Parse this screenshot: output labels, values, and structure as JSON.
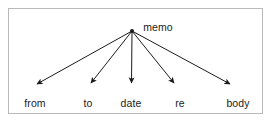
{
  "diagram": {
    "type": "tree",
    "title_visible": false,
    "root": {
      "label": "memo",
      "node_icon": "filled-dot-node",
      "x": 132,
      "y": 31,
      "label_x": 158,
      "label_y": 21
    },
    "children": [
      {
        "label": "from",
        "x": 35,
        "y": 97,
        "arrow_tip_x": 36,
        "arrow_tip_y": 88,
        "arrow": "solid-arrowhead"
      },
      {
        "label": "to",
        "x": 88,
        "y": 97,
        "arrow_tip_x": 90,
        "arrow_tip_y": 88,
        "arrow": "solid-arrowhead"
      },
      {
        "label": "date",
        "x": 131,
        "y": 97,
        "arrow_tip_x": 131,
        "arrow_tip_y": 88,
        "arrow": "solid-arrowhead"
      },
      {
        "label": "re",
        "x": 180,
        "y": 97,
        "arrow_tip_x": 175,
        "arrow_tip_y": 88,
        "arrow": "solid-arrowhead"
      },
      {
        "label": "body",
        "x": 238,
        "y": 97,
        "arrow_tip_x": 231,
        "arrow_tip_y": 88,
        "arrow": "solid-arrowhead"
      }
    ],
    "colors": {
      "background": "#ffffff",
      "border": "#b9b9b9",
      "edge": "#1b1b1b",
      "text": "#1b1b1b"
    }
  }
}
